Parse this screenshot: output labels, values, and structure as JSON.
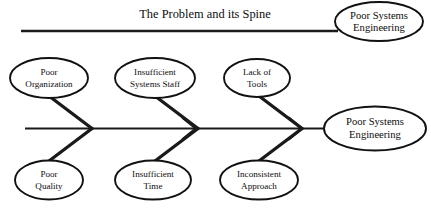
{
  "diagram": {
    "type": "fishbone-ishikawa",
    "title": "The Problem and its Spine",
    "background_color": "#ffffff",
    "line_color": "#111111",
    "effect_label_line1": "Poor Systems",
    "effect_label_line2": "Engineering",
    "callout": {
      "label_line1": "Poor Systems",
      "label_line2": "Engineering"
    },
    "causes_upper": [
      {
        "line1": "Poor",
        "line2": "Organization"
      },
      {
        "line1": "Insufficient",
        "line2": "Systems Staff"
      },
      {
        "line1": "Lack of",
        "line2": "Tools"
      }
    ],
    "causes_lower": [
      {
        "line1": "Poor",
        "line2": "Quality"
      },
      {
        "line1": "Insufficient",
        "line2": "Time"
      },
      {
        "line1": "Inconsistent",
        "line2": "Approach"
      }
    ]
  }
}
